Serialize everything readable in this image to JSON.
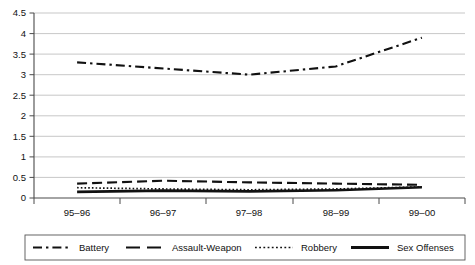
{
  "chart_data": {
    "type": "line",
    "title": "",
    "subtitle": "",
    "xlabel": "",
    "ylabel": "",
    "categories": [
      "95–96",
      "96–97",
      "97–98",
      "98–99",
      "99–00"
    ],
    "ylim": [
      0,
      4.5
    ],
    "yticks": [
      0,
      0.5,
      1,
      1.5,
      2,
      2.5,
      3,
      3.5,
      4,
      4.5
    ],
    "ytick_labels": [
      "0",
      "0.5",
      "1",
      "1.5",
      "2",
      "2.5",
      "3",
      "3.5",
      "4",
      "4.5"
    ],
    "grid": "horizontal",
    "legend_position": "bottom",
    "series": [
      {
        "name": "Battery",
        "style": "dash-dot",
        "color": "#111111",
        "values": [
          3.3,
          3.15,
          3.0,
          3.2,
          3.9
        ]
      },
      {
        "name": "Assault-Weapon",
        "style": "long-dash",
        "color": "#111111",
        "values": [
          0.35,
          0.42,
          0.38,
          0.35,
          0.32
        ]
      },
      {
        "name": "Robbery",
        "style": "dotted",
        "color": "#111111",
        "values": [
          0.25,
          0.22,
          0.2,
          0.22,
          0.27
        ]
      },
      {
        "name": "Sex Offenses",
        "style": "solid",
        "color": "#111111",
        "values": [
          0.15,
          0.18,
          0.16,
          0.19,
          0.26
        ]
      }
    ]
  },
  "legend": {
    "entries": [
      {
        "label": "Battery",
        "style": "dash-dot"
      },
      {
        "label": "Assault-Weapon",
        "style": "long-dash"
      },
      {
        "label": "Robbery",
        "style": "dotted"
      },
      {
        "label": "Sex Offenses",
        "style": "solid"
      }
    ]
  },
  "axes": {
    "y_labels": [
      "4.5",
      "4",
      "3.5",
      "3",
      "2.5",
      "2",
      "1.5",
      "1",
      "0.5",
      "0"
    ],
    "x_labels": [
      "95–96",
      "96–97",
      "97–98",
      "98–99",
      "99–00"
    ]
  }
}
